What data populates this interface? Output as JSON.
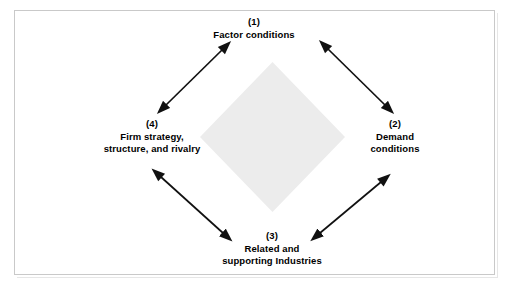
{
  "diagram": {
    "frame": {
      "border_color": "#c9c9c9",
      "background_color": "#ffffff"
    },
    "center_shape": {
      "name": "diamond",
      "fill_color": "#ececec"
    },
    "nodes": [
      {
        "id": "factor-conditions",
        "number": "(1)",
        "lines": [
          "Factor conditions"
        ],
        "position": "top"
      },
      {
        "id": "demand-conditions",
        "number": "(2)",
        "lines": [
          "Demand",
          "conditions"
        ],
        "position": "right"
      },
      {
        "id": "related-supporting-industries",
        "number": "(3)",
        "lines": [
          "Related and",
          "supporting Industries"
        ],
        "position": "bottom"
      },
      {
        "id": "firm-strategy-structure-rivalry",
        "number": "(4)",
        "lines": [
          "Firm strategy,",
          "structure, and rivalry"
        ],
        "position": "left"
      }
    ],
    "connectors": [
      {
        "id": "factor-to-firm",
        "style": "double-headed-arrow",
        "color": "#111111",
        "from": "factor-conditions",
        "to": "firm-strategy-structure-rivalry"
      },
      {
        "id": "factor-to-demand",
        "style": "double-headed-arrow",
        "color": "#111111",
        "from": "factor-conditions",
        "to": "demand-conditions"
      },
      {
        "id": "demand-to-related",
        "style": "double-headed-arrow",
        "color": "#111111",
        "from": "demand-conditions",
        "to": "related-supporting-industries"
      },
      {
        "id": "firm-to-related",
        "style": "double-headed-arrow",
        "color": "#111111",
        "from": "firm-strategy-structure-rivalry",
        "to": "related-supporting-industries"
      }
    ]
  }
}
